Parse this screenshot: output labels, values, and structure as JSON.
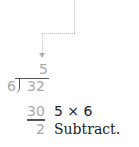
{
  "division": {
    "quotient": "5",
    "divisor": "6",
    "dividend": "32",
    "product": "30",
    "remainder": "2"
  },
  "annotations": {
    "multiply": "5 × 6",
    "subtract": "Subtract."
  },
  "colors": {
    "faded_digits": "#a8a8a8",
    "annotation_text": "#222222",
    "dotted_guide": "#bdbdbd"
  }
}
